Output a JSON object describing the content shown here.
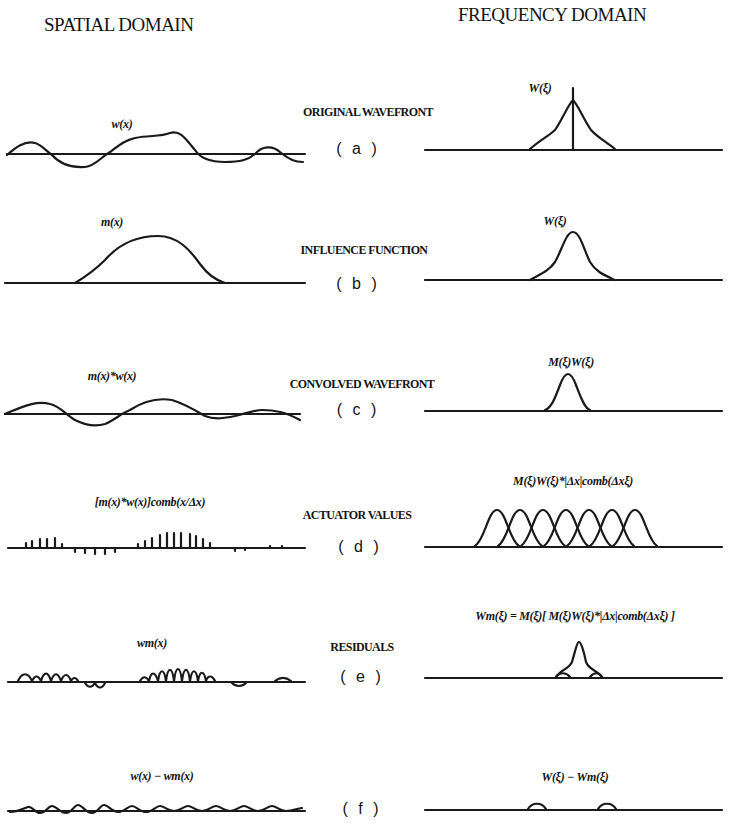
{
  "headers": {
    "spatial": "SPATIAL DOMAIN",
    "frequency": "FREQUENCY DOMAIN"
  },
  "rows": [
    {
      "letter": "( a )",
      "caption": "ORIGINAL WAVEFRONT",
      "spatial_label": "w(x)",
      "frequency_label": "W(ξ)"
    },
    {
      "letter": "( b )",
      "caption": "INFLUENCE FUNCTION",
      "spatial_label": "m(x)",
      "frequency_label": "W(ξ)"
    },
    {
      "letter": "( c )",
      "caption": "CONVOLVED WAVEFRONT",
      "spatial_label": "m(x)*w(x)",
      "frequency_label": "M(ξ)W(ξ)"
    },
    {
      "letter": "( d )",
      "caption": "ACTUATOR VALUES",
      "spatial_label": "[m(x)*w(x)]comb(x/Δx)",
      "frequency_label": "M(ξ)W(ξ)*|Δx|comb(Δxξ)"
    },
    {
      "letter": "( e )",
      "caption": "RESIDUALS",
      "spatial_label": "wm(x)",
      "frequency_label": "Wm(ξ) = M(ξ)[ M(ξ)W(ξ)*|Δx|comb(Δxξ) ]"
    },
    {
      "letter": "( f )",
      "caption": "",
      "spatial_label": "w(x) − wm(x)",
      "frequency_label": "W(ξ) − Wm(ξ)"
    }
  ]
}
